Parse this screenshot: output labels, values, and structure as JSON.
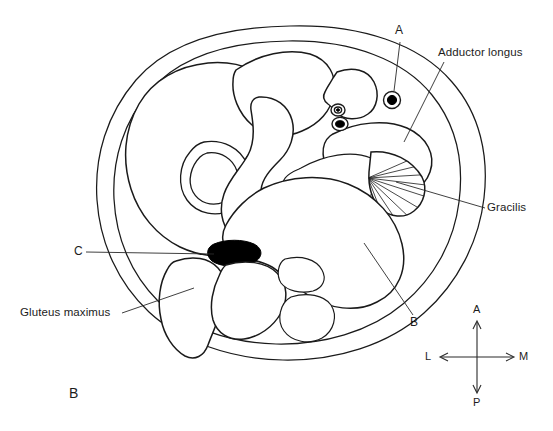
{
  "figure": {
    "panel_label": "B",
    "type": "anatomical-cross-section",
    "region": "thigh",
    "background": "#ffffff",
    "ink_color": "#1a1a1a"
  },
  "callouts": [
    {
      "key": "a",
      "label": "A",
      "target": "vessel-superficial-medial"
    },
    {
      "key": "adductor_longus",
      "label": "Adductor longus",
      "target": "muscle-adductor-longus"
    },
    {
      "key": "gracilis",
      "label": "Gracilis",
      "target": "muscle-gracilis"
    },
    {
      "key": "b",
      "label": "B",
      "target": "muscle-hamstring-medial"
    },
    {
      "key": "c",
      "label": "C",
      "target": "sciatic-nerve"
    },
    {
      "key": "gluteus_maximus",
      "label": "Gluteus maximus",
      "target": "muscle-gluteus-maximus"
    }
  ],
  "compass": {
    "anterior": "A",
    "posterior": "P",
    "lateral": "L",
    "medial": "M"
  },
  "structures": [
    {
      "name": "skin-outline",
      "hatched": false
    },
    {
      "name": "muscle-vastus-lateralis",
      "hatched": true
    },
    {
      "name": "muscle-rectus-femoris",
      "hatched": true
    },
    {
      "name": "muscle-sartorius",
      "hatched": true
    },
    {
      "name": "muscle-adductor-longus",
      "hatched": true
    },
    {
      "name": "muscle-adductor-brevis",
      "hatched": true
    },
    {
      "name": "muscle-adductor-magnus",
      "hatched": true
    },
    {
      "name": "muscle-gracilis",
      "hatched": true
    },
    {
      "name": "muscle-gluteus-maximus",
      "hatched": true
    },
    {
      "name": "muscle-hamstring-medial",
      "hatched": true
    },
    {
      "name": "muscle-hamstring-lateral",
      "hatched": true
    },
    {
      "name": "femur-cortex",
      "hatched": false
    },
    {
      "name": "sciatic-nerve",
      "hatched": false
    },
    {
      "name": "vessel-superficial-medial",
      "hatched": false
    },
    {
      "name": "vessel-femoral-artery",
      "hatched": false
    },
    {
      "name": "vessel-femoral-vein",
      "hatched": false
    }
  ]
}
